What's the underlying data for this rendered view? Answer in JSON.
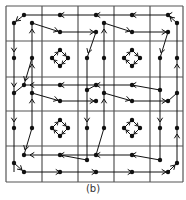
{
  "figure": {
    "caption": "(b)",
    "colors": {
      "background": "#ffffff",
      "grid": "#555555",
      "ink": "#111111"
    },
    "grid": {
      "x_lines": [
        6,
        42,
        78,
        114,
        150,
        183
      ],
      "y_lines": [
        6,
        41,
        77,
        111,
        146,
        182
      ]
    },
    "nodes": [
      [
        24,
        15
      ],
      [
        60,
        15
      ],
      [
        96,
        15
      ],
      [
        132,
        15
      ],
      [
        168,
        15
      ],
      [
        14,
        23
      ],
      [
        32,
        23
      ],
      [
        104,
        23
      ],
      [
        177,
        23
      ],
      [
        60,
        32
      ],
      [
        96,
        32
      ],
      [
        132,
        32
      ],
      [
        168,
        32
      ],
      [
        14,
        58
      ],
      [
        32,
        58
      ],
      [
        87,
        58
      ],
      [
        104,
        58
      ],
      [
        160,
        58
      ],
      [
        177,
        58
      ],
      [
        24,
        85
      ],
      [
        60,
        85
      ],
      [
        96,
        85
      ],
      [
        132,
        85
      ],
      [
        87,
        90
      ],
      [
        160,
        90
      ],
      [
        14,
        93
      ],
      [
        32,
        93
      ],
      [
        104,
        93
      ],
      [
        177,
        93
      ],
      [
        60,
        101
      ],
      [
        96,
        101
      ],
      [
        132,
        101
      ],
      [
        168,
        101
      ],
      [
        14,
        128
      ],
      [
        32,
        128
      ],
      [
        87,
        128
      ],
      [
        104,
        128
      ],
      [
        160,
        128
      ],
      [
        177,
        128
      ],
      [
        24,
        155
      ],
      [
        60,
        155
      ],
      [
        96,
        155
      ],
      [
        132,
        155
      ],
      [
        14,
        163
      ],
      [
        87,
        160
      ],
      [
        160,
        160
      ],
      [
        177,
        163
      ],
      [
        24,
        172
      ],
      [
        60,
        172
      ],
      [
        96,
        172
      ],
      [
        132,
        172
      ],
      [
        168,
        172
      ]
    ],
    "edges": [
      {
        "from": [
          168,
          15
        ],
        "to": [
          24,
          15
        ],
        "arrows_at": [
          [
            60,
            15
          ],
          [
            96,
            15
          ],
          [
            132,
            15
          ],
          [
            168,
            15
          ]
        ],
        "dir": "left"
      },
      {
        "from": [
          24,
          15
        ],
        "to": [
          14,
          23
        ],
        "arrows_at": [
          [
            16,
            21
          ]
        ],
        "dir": "down-left"
      },
      {
        "from": [
          177,
          23
        ],
        "to": [
          168,
          15
        ],
        "arrows_at": [
          [
            170,
            17
          ]
        ],
        "dir": "up-left"
      },
      {
        "from": [
          32,
          23
        ],
        "to": [
          60,
          32
        ],
        "arrows_at": [
          [
            58,
            31
          ]
        ],
        "dir": "right"
      },
      {
        "from": [
          60,
          32
        ],
        "to": [
          96,
          32
        ],
        "arrows_at": [
          [
            94,
            32
          ]
        ],
        "dir": "right"
      },
      {
        "from": [
          104,
          23
        ],
        "to": [
          132,
          32
        ],
        "arrows_at": [
          [
            130,
            31
          ]
        ],
        "dir": "right"
      },
      {
        "from": [
          132,
          32
        ],
        "to": [
          168,
          32
        ],
        "arrows_at": [
          [
            166,
            32
          ]
        ],
        "dir": "right"
      },
      {
        "from": [
          14,
          23
        ],
        "to": [
          14,
          172
        ],
        "arrows_at": [
          [
            14,
            52
          ],
          [
            14,
            87
          ],
          [
            14,
            122
          ]
        ],
        "dir": "down"
      },
      {
        "from": [
          32,
          128
        ],
        "to": [
          32,
          23
        ],
        "arrows_at": [
          [
            32,
            29
          ],
          [
            32,
            64
          ],
          [
            32,
            99
          ]
        ],
        "dir": "up"
      },
      {
        "from": [
          96,
          32
        ],
        "to": [
          87,
          58
        ],
        "arrows_at": [
          [
            88,
            53
          ]
        ],
        "dir": "down"
      },
      {
        "from": [
          87,
          58
        ],
        "to": [
          87,
          160
        ],
        "arrows_at": [
          [
            87,
            122
          ]
        ],
        "dir": "down"
      },
      {
        "from": [
          104,
          128
        ],
        "to": [
          104,
          23
        ],
        "arrows_at": [
          [
            104,
            29
          ],
          [
            104,
            99
          ]
        ],
        "dir": "up"
      },
      {
        "from": [
          168,
          32
        ],
        "to": [
          160,
          58
        ],
        "arrows_at": [
          [
            161,
            53
          ]
        ],
        "dir": "down"
      },
      {
        "from": [
          160,
          58
        ],
        "to": [
          160,
          160
        ],
        "arrows_at": [
          [
            160,
            122
          ]
        ],
        "dir": "down"
      },
      {
        "from": [
          177,
          163
        ],
        "to": [
          177,
          23
        ],
        "arrows_at": [
          [
            177,
            64
          ],
          [
            177,
            134
          ]
        ],
        "dir": "up"
      },
      {
        "from": [
          32,
          58
        ],
        "to": [
          24,
          85
        ],
        "arrows_at": [
          [
            25,
            81
          ]
        ],
        "dir": "down"
      },
      {
        "from": [
          132,
          85
        ],
        "to": [
          24,
          85
        ],
        "arrows_at": [
          [
            30,
            85
          ],
          [
            60,
            85
          ],
          [
            96,
            85
          ],
          [
            132,
            85
          ]
        ],
        "dir": "left"
      },
      {
        "from": [
          96,
          85
        ],
        "to": [
          87,
          90
        ],
        "arrows_at": [],
        "dir": "down"
      },
      {
        "from": [
          24,
          85
        ],
        "to": [
          14,
          93
        ],
        "arrows_at": [],
        "dir": "down"
      },
      {
        "from": [
          32,
          93
        ],
        "to": [
          60,
          101
        ],
        "arrows_at": [
          [
            58,
            100
          ]
        ],
        "dir": "right"
      },
      {
        "from": [
          60,
          101
        ],
        "to": [
          96,
          101
        ],
        "arrows_at": [
          [
            94,
            101
          ]
        ],
        "dir": "right"
      },
      {
        "from": [
          104,
          93
        ],
        "to": [
          132,
          101
        ],
        "arrows_at": [
          [
            130,
            100
          ]
        ],
        "dir": "right"
      },
      {
        "from": [
          132,
          101
        ],
        "to": [
          168,
          101
        ],
        "arrows_at": [
          [
            166,
            101
          ]
        ],
        "dir": "right"
      },
      {
        "from": [
          132,
          85
        ],
        "to": [
          160,
          90
        ],
        "arrows_at": [],
        "dir": "right"
      },
      {
        "from": [
          168,
          101
        ],
        "to": [
          177,
          93
        ],
        "arrows_at": [],
        "dir": "up"
      },
      {
        "from": [
          32,
          128
        ],
        "to": [
          24,
          155
        ],
        "arrows_at": [
          [
            25,
            150
          ]
        ],
        "dir": "down"
      },
      {
        "from": [
          104,
          128
        ],
        "to": [
          96,
          155
        ],
        "arrows_at": [],
        "dir": "down"
      },
      {
        "from": [
          132,
          155
        ],
        "to": [
          24,
          155
        ],
        "arrows_at": [
          [
            30,
            155
          ],
          [
            60,
            155
          ],
          [
            96,
            155
          ],
          [
            132,
            155
          ]
        ],
        "dir": "left"
      },
      {
        "from": [
          132,
          155
        ],
        "to": [
          160,
          160
        ],
        "arrows_at": [],
        "dir": "right"
      },
      {
        "from": [
          60,
          155
        ],
        "to": [
          87,
          160
        ],
        "arrows_at": [],
        "dir": "right"
      },
      {
        "from": [
          14,
          163
        ],
        "to": [
          24,
          172
        ],
        "arrows_at": [
          [
            22,
            170
          ]
        ],
        "dir": "down-right"
      },
      {
        "from": [
          24,
          172
        ],
        "to": [
          168,
          172
        ],
        "arrows_at": [
          [
            60,
            172
          ],
          [
            96,
            172
          ],
          [
            132,
            172
          ],
          [
            166,
            172
          ]
        ],
        "dir": "right"
      },
      {
        "from": [
          168,
          172
        ],
        "to": [
          177,
          163
        ],
        "arrows_at": [
          [
            175,
            165
          ]
        ],
        "dir": "up-right"
      }
    ],
    "diamonds": [
      {
        "cx": 60,
        "cy": 58
      },
      {
        "cx": 132,
        "cy": 58
      },
      {
        "cx": 60,
        "cy": 128
      },
      {
        "cx": 132,
        "cy": 128
      }
    ]
  }
}
